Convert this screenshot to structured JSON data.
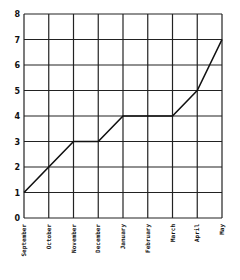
{
  "chart_data": {
    "type": "line",
    "title": "",
    "xlabel": "",
    "ylabel": "",
    "categories": [
      "September",
      "October",
      "November",
      "December",
      "January",
      "February",
      "March",
      "April",
      "May"
    ],
    "series": [
      {
        "name": "",
        "values": [
          1,
          2,
          3,
          3,
          4,
          4,
          4,
          5,
          7
        ]
      }
    ],
    "ylim": [
      0,
      8
    ],
    "yticks": [
      0,
      1,
      2,
      3,
      4,
      5,
      6,
      7,
      8
    ],
    "grid": true,
    "legend": null,
    "colors": {
      "line": "#111111",
      "grid": "#222222",
      "background": "#ffffff"
    }
  }
}
